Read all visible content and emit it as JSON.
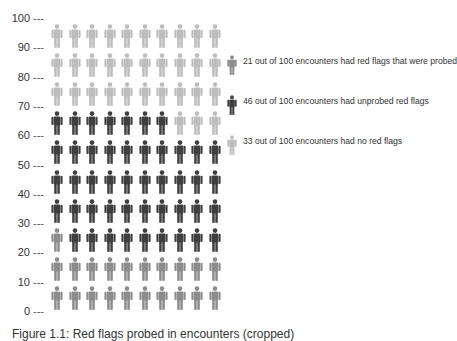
{
  "chart_data": {
    "type": "pictogram",
    "title": "",
    "xlabel": "",
    "ylabel": "",
    "ylim": [
      0,
      100
    ],
    "yticks": [
      100,
      90,
      80,
      70,
      60,
      50,
      40,
      30,
      20,
      10,
      0
    ],
    "grid_columns": 10,
    "grid_rows": 10,
    "series": [
      {
        "name": "21 out of 100 encounters had red flags that were probed",
        "value": 21,
        "color": "#8c8c8c"
      },
      {
        "name": "46 out of 100 encounters had unprobed red flags",
        "value": 46,
        "color": "#3f3f3f"
      },
      {
        "name": "33 out of 100 encounters had no red flags",
        "value": 33,
        "color": "#bdbdbd"
      }
    ],
    "rows_top_to_bottom": [
      [
        "none",
        "none",
        "none",
        "none",
        "none",
        "none",
        "none",
        "none",
        "none",
        "none"
      ],
      [
        "none",
        "none",
        "none",
        "none",
        "none",
        "none",
        "none",
        "none",
        "none",
        "none"
      ],
      [
        "none",
        "none",
        "none",
        "none",
        "none",
        "none",
        "none",
        "none",
        "none",
        "none"
      ],
      [
        "unprobed",
        "unprobed",
        "unprobed",
        "unprobed",
        "unprobed",
        "unprobed",
        "unprobed",
        "none",
        "none",
        "none"
      ],
      [
        "unprobed",
        "unprobed",
        "unprobed",
        "unprobed",
        "unprobed",
        "unprobed",
        "unprobed",
        "unprobed",
        "unprobed",
        "unprobed"
      ],
      [
        "unprobed",
        "unprobed",
        "unprobed",
        "unprobed",
        "unprobed",
        "unprobed",
        "unprobed",
        "unprobed",
        "unprobed",
        "unprobed"
      ],
      [
        "unprobed",
        "unprobed",
        "unprobed",
        "unprobed",
        "unprobed",
        "unprobed",
        "unprobed",
        "unprobed",
        "unprobed",
        "unprobed"
      ],
      [
        "probed",
        "unprobed",
        "unprobed",
        "unprobed",
        "unprobed",
        "unprobed",
        "unprobed",
        "unprobed",
        "unprobed",
        "unprobed"
      ],
      [
        "probed",
        "probed",
        "probed",
        "probed",
        "probed",
        "probed",
        "probed",
        "probed",
        "probed",
        "probed"
      ],
      [
        "probed",
        "probed",
        "probed",
        "probed",
        "probed",
        "probed",
        "probed",
        "probed",
        "probed",
        "probed"
      ]
    ],
    "legend_position": "right"
  },
  "yaxis": {
    "dash": "---",
    "labels": [
      "100",
      "90",
      "80",
      "70",
      "60",
      "50",
      "40",
      "30",
      "20",
      "10",
      "0"
    ]
  },
  "legend": {
    "items": [
      {
        "key": "probed",
        "label": "21 out of 100 encounters had red flags that were probed",
        "color": "#8c8c8c"
      },
      {
        "key": "unprobed",
        "label": "46 out of 100 encounters had unprobed red flags",
        "color": "#3f3f3f"
      },
      {
        "key": "none",
        "label": "33 out of 100 encounters had no red flags",
        "color": "#bdbdbd"
      }
    ]
  },
  "colors": {
    "probed": "#8c8c8c",
    "unprobed": "#3f3f3f",
    "none": "#bdbdbd"
  },
  "caption": {
    "text": "Figure 1.1: Red flags probed in encounters (cropped)"
  }
}
